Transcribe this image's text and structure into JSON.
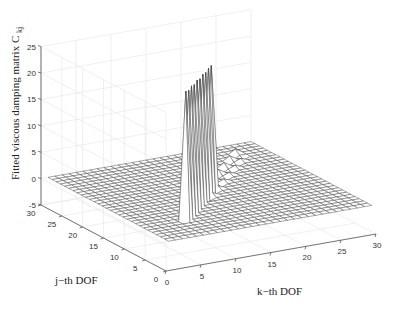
{
  "chart_data": {
    "type": "surface3d",
    "title": "",
    "zlabel": "Fitted viscous damping matrix C",
    "zlabel_subscript": "kj",
    "xlabel": "k−th DOF",
    "ylabel": "j−th DOF",
    "x_ticks": [
      0,
      5,
      10,
      15,
      20,
      25,
      30
    ],
    "y_ticks": [
      0,
      5,
      10,
      15,
      20,
      25,
      30
    ],
    "z_ticks": [
      -5,
      0,
      5,
      10,
      15,
      20,
      25
    ],
    "xlim": [
      0,
      30
    ],
    "ylim": [
      0,
      30
    ],
    "zlim": [
      -5,
      25
    ],
    "grid": true,
    "mesh_size": [
      30,
      30
    ],
    "mesh_range": [
      1,
      30
    ],
    "baseline_value": 0,
    "diagonal_spikes": {
      "description": "Large positive values on the diagonal k = j",
      "indices": [
        7,
        8,
        9,
        10,
        11,
        12,
        13,
        14,
        15,
        16
      ],
      "values": [
        24.5,
        24.0,
        24.2,
        23.8,
        24.0,
        23.6,
        23.8,
        23.5,
        23.7,
        23.5
      ]
    },
    "near_diagonal_ripple": {
      "description": "Small oscillating values just off the diagonal",
      "range": [
        14,
        26
      ],
      "amplitude": 0.8
    }
  },
  "labels": {
    "z_axis": "Fitted viscous damping matrix C",
    "z_axis_sub": "kj",
    "k_axis": "k−th DOF",
    "j_axis": "j−th DOF"
  }
}
